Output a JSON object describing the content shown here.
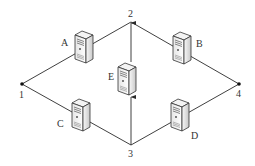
{
  "diagram": {
    "type": "network-topology",
    "colors": {
      "line": "#2a2a2a",
      "server_face": "#f2f2f2",
      "server_side": "#d8d8d8",
      "server_outline": "#333333",
      "label": "#333333"
    },
    "nodes": [
      {
        "id": "1",
        "label": "1"
      },
      {
        "id": "2",
        "label": "2"
      },
      {
        "id": "3",
        "label": "3"
      },
      {
        "id": "4",
        "label": "4"
      }
    ],
    "servers": [
      {
        "id": "A",
        "label": "A"
      },
      {
        "id": "B",
        "label": "B"
      },
      {
        "id": "C",
        "label": "C"
      },
      {
        "id": "D",
        "label": "D"
      },
      {
        "id": "E",
        "label": "E"
      }
    ],
    "edges": [
      {
        "from": "1",
        "to": "2",
        "via": "A"
      },
      {
        "from": "2",
        "to": "4",
        "via": "B"
      },
      {
        "from": "1",
        "to": "3",
        "via": "C"
      },
      {
        "from": "3",
        "to": "4",
        "via": "D"
      },
      {
        "from": "3",
        "to": "2",
        "via": "E",
        "directed": true
      }
    ]
  }
}
